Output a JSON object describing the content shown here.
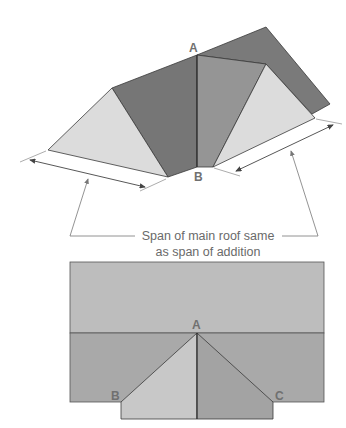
{
  "diagram": {
    "perspective_view": {
      "labels": {
        "a": "A",
        "b": "B"
      }
    },
    "caption": {
      "line1": "Span of main roof same",
      "line2": "as span of addition"
    },
    "plan_view": {
      "labels": {
        "a": "A",
        "b": "B",
        "c": "C"
      }
    },
    "colors": {
      "dark_face": "#7a7a7a",
      "mid_face": "#959595",
      "light_face": "#dcdcdc",
      "plan_top": "#bdbdbd",
      "plan_bottom": "#a8a8a8",
      "plan_left_triangle": "#c8c8c8",
      "plan_right_triangle": "#a3a3a3",
      "outline": "#3a3a3a",
      "annotation": "#6a6a6a"
    }
  }
}
